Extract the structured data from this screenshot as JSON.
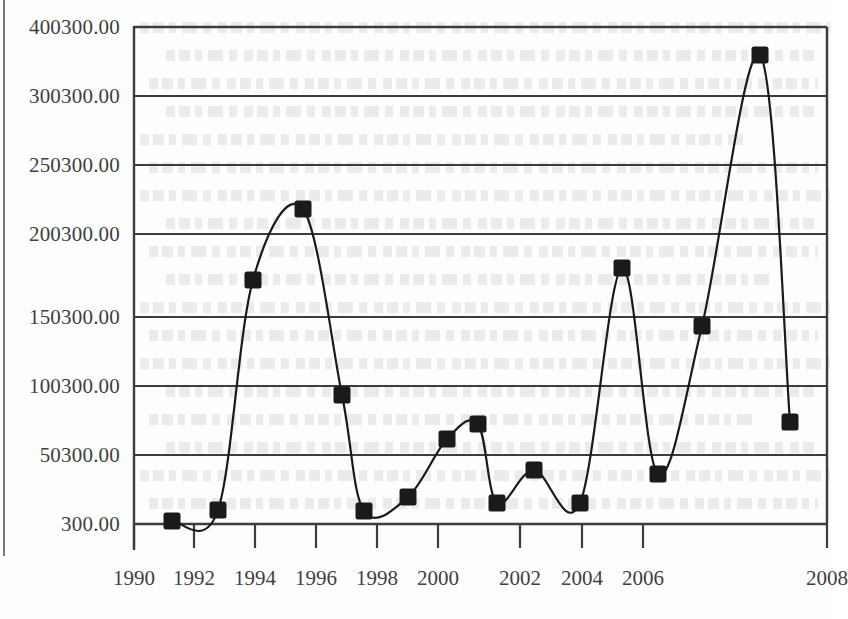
{
  "figure": {
    "kind": "scanned-line-chart",
    "ink_color": "#1a1a1a",
    "grid_color": "#3c3c3c",
    "paper_color": "#fdfdfd"
  },
  "chart_data": {
    "type": "line",
    "title": "",
    "xlabel": "",
    "ylabel": "",
    "grid": true,
    "legend": null,
    "marker": "filled-square",
    "line_style": "smooth-spline",
    "x": [
      1991,
      1992,
      1993,
      1994,
      1995,
      1996,
      1997,
      1998,
      1999,
      2000,
      2001,
      2002,
      2003,
      2004,
      2005,
      2006,
      2007
    ],
    "values": [
      1800,
      9500,
      170300,
      218300,
      91300,
      9000,
      18300,
      57300,
      68300,
      16800,
      36300,
      16500,
      179300,
      35300,
      135300,
      378300,
      69300
    ],
    "x_tick_labels": [
      "1990",
      "1992",
      "1994",
      "1996",
      "1998",
      "2000",
      "2002",
      "2004",
      "2006",
      "2008"
    ],
    "x_tick_values": [
      1990,
      1992,
      1994,
      1996,
      1998,
      2000,
      2002,
      2004,
      2006,
      2008
    ],
    "y_tick_labels": [
      "400300.00",
      "300300.00",
      "250300.00",
      "200300.00",
      "150300.00",
      "100300.00",
      "50300.00",
      "300.00"
    ],
    "y_tick_values": [
      400300,
      300300,
      250300,
      200300,
      150300,
      100300,
      50300,
      300
    ],
    "xlim": [
      1990,
      2008
    ],
    "ylim": [
      300,
      400300
    ],
    "note": "Y axis tick labels are evenly spaced on the plot but unevenly valued (400300, 300300, 250300, 200300, 150300, 100300, 50300, 300)."
  },
  "geometry": {
    "plot_left": 134,
    "plot_right": 827,
    "plot_top": 27,
    "plot_bottom": 524,
    "y_tick_pixels": [
      27,
      96,
      165,
      234,
      317,
      386,
      455,
      524
    ],
    "x_tick_pixels": [
      134,
      194,
      255,
      316,
      377,
      438,
      520,
      582,
      643,
      827
    ],
    "point_pixels": [
      [
        172,
        521
      ],
      [
        218,
        510
      ],
      [
        253,
        280
      ],
      [
        303,
        209
      ],
      [
        342,
        395
      ],
      [
        364,
        511
      ],
      [
        408,
        497
      ],
      [
        447,
        439
      ],
      [
        478,
        424
      ],
      [
        497,
        503
      ],
      [
        534,
        470
      ],
      [
        580,
        503
      ],
      [
        622,
        268
      ],
      [
        658,
        474
      ],
      [
        702,
        326
      ],
      [
        760,
        55
      ],
      [
        790,
        422
      ]
    ]
  }
}
